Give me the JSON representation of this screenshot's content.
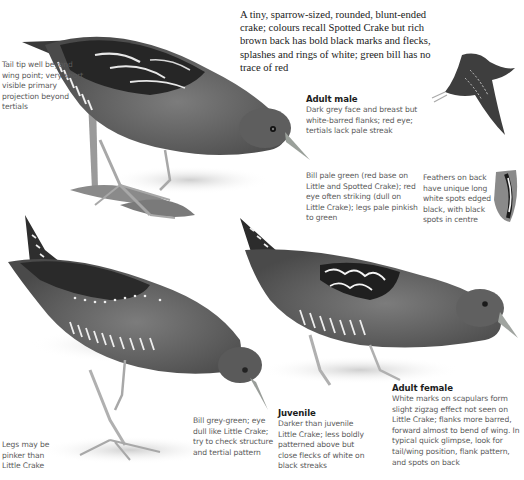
{
  "intro": {
    "text": "A tiny, sparrow-sized, rounded, blunt-ended crake; colours recall Spotted Crake but rich brown back has bold black marks and flecks, splashes and rings of white; green bill has no trace of red"
  },
  "captions": {
    "tail_tip": {
      "text": "Tail tip well beyond wing point; very short visible primary projection beyond tertials"
    },
    "adult_male": {
      "heading": "Adult male",
      "text": "Dark grey face and breast but white-barred flanks; red eye; tertials lack pale streak"
    },
    "bill": {
      "text": "Bill pale green (red base on Little and Spotted Crake); red eye often striking (dull on Little Crake); legs pale pinkish to green"
    },
    "feathers": {
      "text": "Feathers on back have unique long white spots edged black, with black spots in centre"
    },
    "legs": {
      "text": "Legs may be pinker than Little Crake"
    },
    "juvenile_bill": {
      "text": "Bill grey-green; eye dull like Little Crake; try to check structure and tertial pattern"
    },
    "juvenile": {
      "heading": "Juvenile",
      "text": "Darker than juvenile Little Crake; less boldly patterned above but close flecks of white on black streaks"
    },
    "adult_female": {
      "heading": "Adult female",
      "text": "White marks on scapulars form slight zigzag effect not seen on Little Crake; flanks more barred, forward almost to bend of wing. In typical quick glimpse, look for tail/wing position, flank pattern, and spots on back"
    }
  },
  "illustrations": {
    "colors": {
      "body": "#6e6e6e",
      "back_dark": "#2a2a2a",
      "flank": "#4a4a4a",
      "white_marks": "#f2f2f2",
      "leg": "#b8b8b8",
      "shadow": "#d6d6d6",
      "leaf": "#8a8a8a"
    }
  }
}
